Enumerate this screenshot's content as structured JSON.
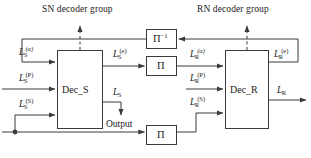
{
  "figure": {
    "type": "block-diagram",
    "title_sn": "SN decoder group",
    "title_rn": "RN decoder group",
    "line_color": "#3a3a3a",
    "text_color": "#1a1a1a",
    "background": "#ffffff"
  },
  "blocks": {
    "dec_s": {
      "label": "Dec_S"
    },
    "dec_r": {
      "label": "Dec_R"
    },
    "deinterleaver": {
      "label": "Π",
      "sup": "−1"
    },
    "interleaver_top": {
      "label": "Π"
    },
    "interleaver_bottom": {
      "label": "Π"
    }
  },
  "signals": {
    "s_apriori": {
      "base": "L",
      "sub": "S",
      "sup": "(α)"
    },
    "s_parity": {
      "base": "L",
      "sub": "S",
      "sup": "(P)"
    },
    "s_systematic": {
      "base": "L",
      "sub": "S",
      "sup": "(S)"
    },
    "s_extrinsic": {
      "base": "L",
      "sub": "S",
      "sup": "(e)"
    },
    "s_output": {
      "base": "L",
      "sub": "S",
      "sup": ""
    },
    "r_apriori": {
      "base": "L",
      "sub": "R",
      "sup": "(α)"
    },
    "r_parity": {
      "base": "L",
      "sub": "R",
      "sup": "(P)"
    },
    "r_systematic": {
      "base": "L",
      "sub": "R",
      "sup": "(S)"
    },
    "r_extrinsic": {
      "base": "L",
      "sub": "R",
      "sup": "(e)"
    },
    "r_output": {
      "base": "L",
      "sub": "R",
      "sup": ""
    }
  },
  "annotations": {
    "output": "Output"
  }
}
